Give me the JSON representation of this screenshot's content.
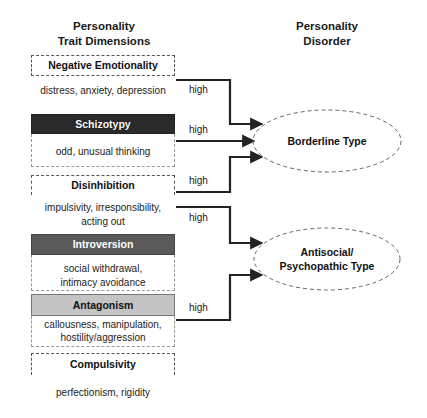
{
  "headers": {
    "traits": {
      "line1": "Personality",
      "line2": "Trait Dimensions"
    },
    "disorders": {
      "line1": "Personality",
      "line2": "Disorder"
    }
  },
  "traits": [
    {
      "name": "Negative Emotionality",
      "style": "light",
      "desc": [
        "distress, anxiety, depression"
      ]
    },
    {
      "name": "Schizotypy",
      "style": "dark",
      "desc": [
        "odd, unusual thinking"
      ]
    },
    {
      "name": "Disinhibition",
      "style": "light",
      "desc": [
        "impulsivity, irresponsibility,",
        "acting out"
      ]
    },
    {
      "name": "Introversion",
      "style": "medium",
      "desc": [
        "social withdrawal,",
        "intimacy avoidance"
      ]
    },
    {
      "name": "Antagonism",
      "style": "pale",
      "desc": [
        "callousness, manipulation,",
        "hostility/aggression"
      ]
    },
    {
      "name": "Compulsivity",
      "style": "light",
      "desc": [
        "perfectionism, rigidity"
      ]
    }
  ],
  "connections": [
    {
      "from": "Negative Emotionality",
      "to": "Borderline Type",
      "label": "high"
    },
    {
      "from": "Schizotypy",
      "to": "Borderline Type",
      "label": "high"
    },
    {
      "from": "Disinhibition",
      "to": "Borderline Type",
      "label": "high"
    },
    {
      "from": "Disinhibition",
      "to": "Antisocial/Psychopathic Type",
      "label": "high"
    },
    {
      "from": "Antagonism",
      "to": "Antisocial/Psychopathic Type",
      "label": "high"
    }
  ],
  "disorders": [
    {
      "line1": "Borderline Type",
      "line2": ""
    },
    {
      "line1": "Antisocial/",
      "line2": "Psychopathic Type"
    }
  ]
}
